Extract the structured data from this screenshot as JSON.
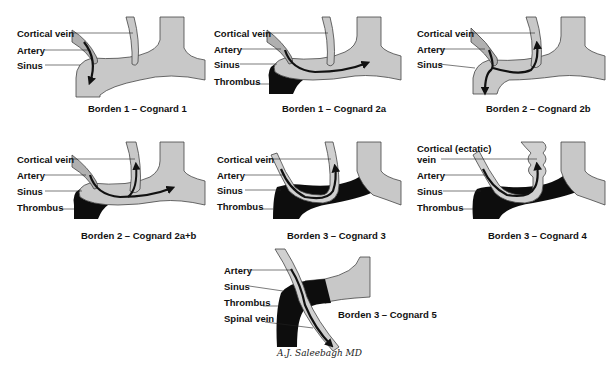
{
  "colors": {
    "vessel_fill": "#c8c8c8",
    "vessel_stroke": "#444444",
    "thrombus": "#0d0d0d",
    "arrow": "#111111",
    "background": "#ffffff"
  },
  "panels": [
    {
      "id": "b1c1",
      "caption": "Borden 1 – Cognard 1",
      "labels": [
        "Cortical vein",
        "Artery",
        "Sinus"
      ],
      "flow": "anterograde into sinus"
    },
    {
      "id": "b1c2a",
      "caption": "Borden 1 – Cognard 2a",
      "labels": [
        "Cortical vein",
        "Artery",
        "Sinus",
        "Thrombus"
      ],
      "flow": "retrograde within sinus"
    },
    {
      "id": "b2c2b",
      "caption": "Borden 2 – Cognard 2b",
      "labels": [
        "Cortical vein",
        "Artery",
        "Sinus"
      ],
      "flow": "anterograde sinus + retrograde cortical vein"
    },
    {
      "id": "b2c2ab",
      "caption": "Borden 2 – Cognard 2a+b",
      "labels": [
        "Cortical vein",
        "Artery",
        "Sinus",
        "Thrombus"
      ],
      "flow": "retrograde sinus + cortical vein"
    },
    {
      "id": "b3c3",
      "caption": "Borden 3 – Cognard 3",
      "labels": [
        "Cortical vein",
        "Artery",
        "Sinus",
        "Thrombus"
      ],
      "flow": "direct cortical venous drainage"
    },
    {
      "id": "b3c4",
      "caption": "Borden 3 – Cognard 4",
      "labels": [
        "Cortical (ectatic)",
        "vein",
        "Artery",
        "Sinus",
        "Thrombus"
      ],
      "flow": "cortical drainage with venous ectasia"
    },
    {
      "id": "b3c5",
      "caption": "Borden 3 – Cognard 5",
      "labels": [
        "Artery",
        "Sinus",
        "Thrombus",
        "Spinal vein"
      ],
      "flow": "spinal perimedullary venous drainage"
    }
  ],
  "signature": "A.J. Saleebagh MD"
}
